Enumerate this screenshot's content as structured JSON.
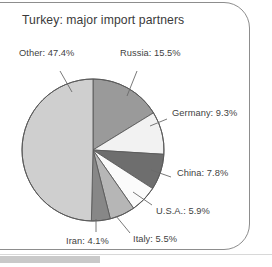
{
  "chart_title": "Turkey: major import partners",
  "chart_data": {
    "type": "pie",
    "title": "Turkey: major import partners",
    "xlabel": "",
    "ylabel": "",
    "legend_position": "none",
    "grid": false,
    "categories": [
      "Russia",
      "Germany",
      "China",
      "U.S.A.",
      "Italy",
      "Iran",
      "Other"
    ],
    "values": [
      15.5,
      9.3,
      7.8,
      5.9,
      5.5,
      4.1,
      47.4
    ],
    "unit": "%",
    "start_angle_deg": 0,
    "direction": "clockwise",
    "slices": [
      {
        "label": "Russia",
        "value": 15.5,
        "text": "Russia: 15.5%",
        "color": "#9a9a9a"
      },
      {
        "label": "Germany",
        "value": 9.3,
        "text": "Germany: 9.3%",
        "color": "#f2f2f2"
      },
      {
        "label": "China",
        "value": 7.8,
        "text": "China: 7.8%",
        "color": "#6e6e6e"
      },
      {
        "label": "U.S.A.",
        "value": 5.9,
        "text": "U.S.A.: 5.9%",
        "color": "#fbfbfb"
      },
      {
        "label": "Italy",
        "value": 5.5,
        "text": "Italy: 5.5%",
        "color": "#b6b6b6"
      },
      {
        "label": "Iran",
        "value": 4.1,
        "text": "Iran: 4.1%",
        "color": "#878787"
      },
      {
        "label": "Other",
        "value": 47.4,
        "text": "Other: 47.4%",
        "color": "#cfcfcf"
      }
    ],
    "annotations": [
      "Other: 47.4%",
      "Russia: 15.5%",
      "Germany: 9.3%",
      "China: 7.8%",
      "U.S.A.: 5.9%",
      "Italy: 5.5%",
      "Iran: 4.1%"
    ]
  },
  "labels": {
    "other": "Other: 47.4%",
    "russia": "Russia: 15.5%",
    "germany": "Germany: 9.3%",
    "china": "China: 7.8%",
    "usa": "U.S.A.: 5.9%",
    "italy": "Italy: 5.5%",
    "iran": "Iran: 4.1%"
  },
  "colors": {
    "outline": "#5a5a5a",
    "leader_line": "#6a6a6a",
    "text": "#3f3f3f",
    "frame": "#8d8d8d",
    "footer_bar": "#c9c9c9"
  }
}
